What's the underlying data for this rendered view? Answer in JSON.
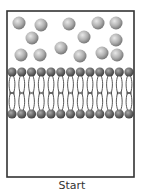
{
  "caption": "Start",
  "frame": {
    "x": 7,
    "y": 11,
    "width": 127,
    "height": 166,
    "stroke": "#333333"
  },
  "colors": {
    "solute_light": "#e8e8e8",
    "solute_mid": "#b0b0b0",
    "solute_dark": "#6e6e6e",
    "head_light": "#a9a9a9",
    "head_mid": "#6a6a6a",
    "head_dark": "#3a3a3a",
    "tail": "#444444"
  },
  "solutes": [
    {
      "x": 19,
      "y": 23
    },
    {
      "x": 41,
      "y": 25
    },
    {
      "x": 69,
      "y": 24
    },
    {
      "x": 98,
      "y": 23
    },
    {
      "x": 116,
      "y": 23
    },
    {
      "x": 32,
      "y": 38
    },
    {
      "x": 84,
      "y": 37
    },
    {
      "x": 116,
      "y": 40
    },
    {
      "x": 61,
      "y": 48
    },
    {
      "x": 21,
      "y": 55
    },
    {
      "x": 40,
      "y": 55
    },
    {
      "x": 80,
      "y": 56
    },
    {
      "x": 102,
      "y": 53
    },
    {
      "x": 117,
      "y": 55
    }
  ],
  "solute_radius": 6.5,
  "bilayer": {
    "head_count": 13,
    "first_head_x": 12,
    "spacing": 9.75,
    "top_row_y": 72,
    "bottom_row_y": 114,
    "mid_y": 93,
    "head_radius": 4.6
  }
}
